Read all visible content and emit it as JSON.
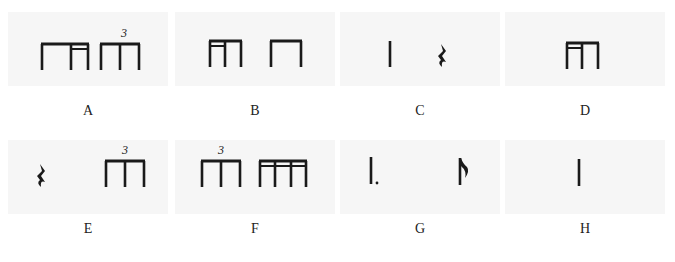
{
  "colors": {
    "ink": "#1a1a1a",
    "panel": "#f6f6f6",
    "background": "#ffffff"
  },
  "options": [
    {
      "id": "A",
      "label": "A",
      "content": "eighth + sixteenth + sixteenth beamed group, then eighth-note triplet",
      "tuplet": "3"
    },
    {
      "id": "B",
      "label": "B",
      "content": "sixteenth-sixteenth-eighth beamed group, then two beamed eighths",
      "tuplet": ""
    },
    {
      "id": "C",
      "label": "C",
      "content": "quarter note, quarter rest",
      "tuplet": ""
    },
    {
      "id": "D",
      "label": "D",
      "content": "sixteenth-sixteenth-eighth beamed group",
      "tuplet": ""
    },
    {
      "id": "E",
      "label": "E",
      "content": "quarter rest, eighth-note triplet",
      "tuplet": "3"
    },
    {
      "id": "F",
      "label": "F",
      "content": "eighth-note triplet, four beamed sixteenths",
      "tuplet": "3"
    },
    {
      "id": "G",
      "label": "G",
      "content": "dotted quarter note, eighth note",
      "tuplet": ""
    },
    {
      "id": "H",
      "label": "H",
      "content": "quarter note",
      "tuplet": ""
    }
  ]
}
